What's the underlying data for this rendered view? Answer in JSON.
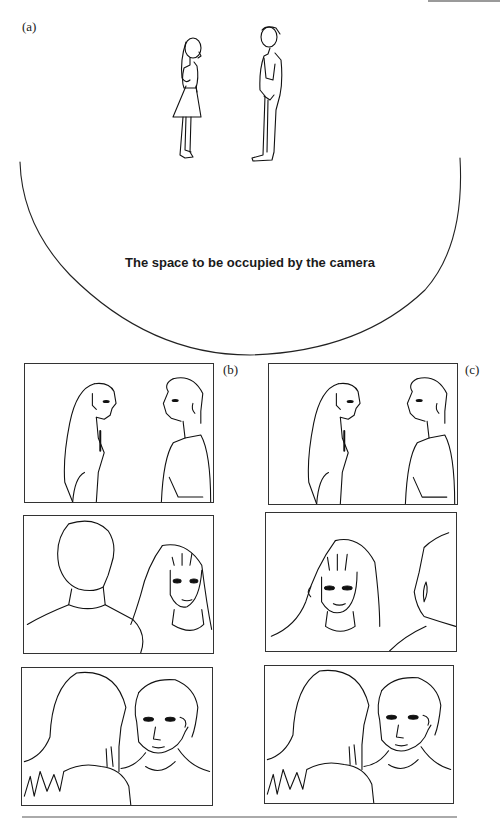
{
  "figure": {
    "panel_labels": {
      "a": "(a)",
      "b": "(b)",
      "c": "(c)"
    },
    "caption": "The space to be occupied by the camera",
    "panel_a": {
      "description": "Overhead staging: woman in dress (left) and man (right) facing each other, semicircular camera zone below"
    },
    "panel_b": {
      "frames": [
        {
          "shot": "two-shot profile",
          "left": "woman",
          "right": "man"
        },
        {
          "shot": "over-the-shoulder",
          "foreground": "man (back, left)",
          "subject": "woman (right)"
        },
        {
          "shot": "over-the-shoulder",
          "foreground": "woman (back, left)",
          "subject": "man (right)"
        }
      ]
    },
    "panel_c": {
      "frames": [
        {
          "shot": "two-shot profile",
          "left": "woman",
          "right": "man"
        },
        {
          "shot": "over-the-shoulder (crossed line)",
          "foreground": "man (back, right)",
          "subject": "woman (left)"
        },
        {
          "shot": "over-the-shoulder",
          "foreground": "woman (back, left)",
          "subject": "man (right)"
        }
      ]
    }
  }
}
